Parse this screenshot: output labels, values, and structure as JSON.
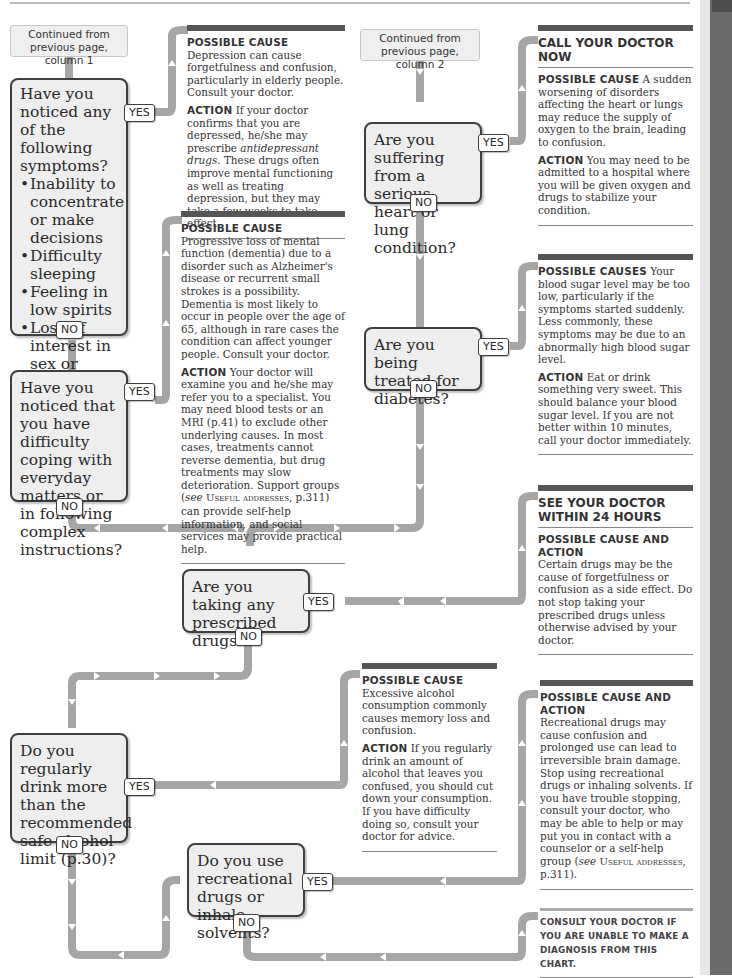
{
  "flowchart": {
    "continuations": [
      {
        "id": "col1",
        "text": "Continued from previous page, column 1"
      },
      {
        "id": "col2",
        "text": "Continued from previous page, column 2"
      }
    ],
    "questions": {
      "q1": {
        "text": "Have you noticed any of the following symptoms?",
        "bullets": [
          "Inability to concentrate or make decisions",
          "Difficulty sleeping",
          "Feeling in low spirits",
          "Loss of interest in sex or activities you normally enjoy"
        ]
      },
      "q2": {
        "text": "Have you noticed that you have difficulty coping with everyday matters or in following complex instructions?"
      },
      "q3": {
        "text": "Are you suffering from a serious heart or lung condition?"
      },
      "q4": {
        "text": "Are you being treated for diabetes?"
      },
      "q5": {
        "text": "Are you taking any prescribed drugs?"
      },
      "q6": {
        "text": "Do you regularly drink more than the recommended safe alcohol limit (p.30)?"
      },
      "q7": {
        "text": "Do you use recreational drugs or inhale solvents?"
      }
    },
    "labels": {
      "yes": "YES",
      "no": "NO"
    },
    "panels": {
      "depression": {
        "cause_label": "Possible cause",
        "cause_text": "Depression can cause forgetfulness and confusion, particularly in elderly people. Consult your doctor.",
        "action_label": "Action",
        "action_text_1": "If your doctor confirms that you are depressed, he/she may prescribe",
        "action_italic": "antidepressant drugs",
        "action_text_2": ". These drugs often improve mental functioning as well as treating depression, but they may take a few weeks to take effect."
      },
      "dementia": {
        "cause_label": "Possible cause",
        "cause_text": "Progressive loss of mental function (dementia) due to a disorder such as Alzheimer's disease or recurrent small strokes is a possibility. Dementia is most likely to occur in people over the age of 65, although in rare cases the condition can affect younger people. Consult your doctor.",
        "action_label": "Action",
        "action_text_1": "Your doctor will examine you and he/she may refer you to a specialist. You may need blood tests or an MRI (p.41) to exclude other underlying causes. In most cases, treatments cannot reverse dementia, but drug treatments may slow deterioration. Support groups (",
        "action_italic": "see",
        "action_sc": "Useful addresses",
        "action_text_2": ", p.311) can provide self-help information, and social services may provide practical help."
      },
      "heart_lung": {
        "heading": "CALL YOUR DOCTOR NOW",
        "cause_label": "Possible cause",
        "cause_text": "A sudden worsening of disorders affecting the heart or lungs may reduce the supply of oxygen to the brain, leading to confusion.",
        "action_label": "Action",
        "action_text": "You may need to be admitted to a hospital where you will be given oxygen and drugs to stabilize your condition."
      },
      "diabetes": {
        "cause_label": "Possible causes",
        "cause_text": "Your blood sugar level may be too low, particularly if the symptoms started suddenly. Less commonly, these symptoms may be due to an abnormally high blood sugar level.",
        "action_label": "Action",
        "action_text": "Eat or drink something very sweet. This should balance your blood sugar level. If you are not better within 10 minutes, call your doctor immediately."
      },
      "prescribed_drugs": {
        "heading": "SEE YOUR DOCTOR WITHIN 24 HOURS",
        "cause_label": "Possible cause and action",
        "cause_text": "Certain drugs may be the cause of forgetfulness or confusion as a side effect. Do not stop taking your prescribed drugs unless otherwise advised by your doctor."
      },
      "alcohol": {
        "cause_label": "Possible cause",
        "cause_text": "Excessive alcohol consumption commonly causes memory loss and confusion.",
        "action_label": "Action",
        "action_text": "If you regularly drink an amount of alcohol that leaves you confused, you should cut down your consumption. If you have difficulty doing so, consult your doctor for advice."
      },
      "recreational": {
        "cause_label": "Possible cause and action",
        "cause_text": "Recreational drugs may cause confusion and prolonged use can lead to irreversible brain damage. Stop using recreational drugs or inhaling solvents. If you have trouble stopping, consult your doctor, who may be able to help or may put you in contact with a counselor or a self-help group (",
        "cause_italic": "see",
        "cause_sc": "Useful addresses",
        "cause_text_2": ", p.311)."
      },
      "final": {
        "text": "Consult your doctor if you are unable to make a diagnosis from this chart."
      }
    },
    "colors": {
      "connector": "#a6a6a6",
      "question_fill": "#eeeeee",
      "question_border": "#3f3f3f",
      "panel_rule": "#555555",
      "side_strip": "#6b6b6b"
    }
  }
}
